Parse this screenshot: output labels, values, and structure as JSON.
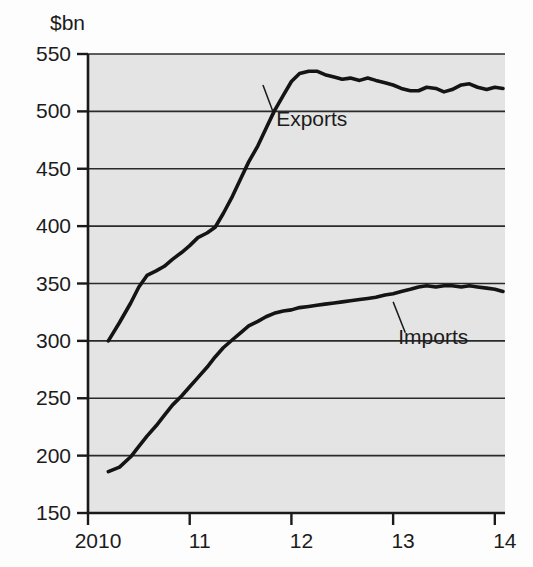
{
  "chart_data": {
    "type": "line",
    "title": "",
    "subtitle": "",
    "unit_label": "$bn",
    "xlabel": "",
    "ylabel": "$bn",
    "grid": true,
    "legend_position": "inline-annotations",
    "xlim": [
      2010.0,
      2014.1
    ],
    "ylim": [
      150,
      550
    ],
    "y_ticks": [
      150,
      200,
      250,
      300,
      350,
      400,
      450,
      500,
      550
    ],
    "y_tick_labels": [
      "150",
      "200",
      "250",
      "300",
      "350",
      "400",
      "450",
      "500",
      "550"
    ],
    "x_ticks": [
      2010,
      2011,
      2012,
      2013,
      2014
    ],
    "x_tick_labels": [
      "2010",
      "11",
      "12",
      "13",
      "14"
    ],
    "annotations": [
      {
        "text": "Exports",
        "x": 2011.85,
        "y": 487
      },
      {
        "text": "Imports",
        "x": 2013.05,
        "y": 297
      }
    ],
    "series": [
      {
        "name": "Exports",
        "color": "#141414",
        "x": [
          2010.2,
          2010.31,
          2010.42,
          2010.5,
          2010.58,
          2010.67,
          2010.75,
          2010.83,
          2010.92,
          2011.0,
          2011.08,
          2011.17,
          2011.25,
          2011.33,
          2011.42,
          2011.5,
          2011.58,
          2011.67,
          2011.75,
          2011.83,
          2011.92,
          2012.0,
          2012.08,
          2012.17,
          2012.25,
          2012.33,
          2012.42,
          2012.5,
          2012.58,
          2012.67,
          2012.75,
          2012.83,
          2012.92,
          2013.0,
          2013.08,
          2013.17,
          2013.25,
          2013.33,
          2013.42,
          2013.5,
          2013.58,
          2013.67,
          2013.75,
          2013.83,
          2013.92,
          2014.0,
          2014.08
        ],
        "values": [
          300,
          316,
          333,
          347,
          357,
          361,
          365,
          371,
          377,
          383,
          390,
          394,
          399,
          411,
          426,
          441,
          456,
          470,
          485,
          500,
          514,
          526,
          533,
          535,
          535,
          532,
          530,
          528,
          529,
          527,
          529,
          527,
          525,
          523,
          520,
          518,
          518,
          521,
          520,
          517,
          519,
          523,
          524,
          521,
          519,
          521,
          520
        ]
      },
      {
        "name": "Imports",
        "color": "#141414",
        "x": [
          2010.2,
          2010.31,
          2010.42,
          2010.5,
          2010.58,
          2010.67,
          2010.75,
          2010.83,
          2010.92,
          2011.0,
          2011.08,
          2011.17,
          2011.25,
          2011.33,
          2011.42,
          2011.5,
          2011.58,
          2011.67,
          2011.75,
          2011.83,
          2011.92,
          2012.0,
          2012.08,
          2012.17,
          2012.25,
          2012.33,
          2012.42,
          2012.5,
          2012.58,
          2012.67,
          2012.75,
          2012.83,
          2012.92,
          2013.0,
          2013.08,
          2013.17,
          2013.25,
          2013.33,
          2013.42,
          2013.5,
          2013.58,
          2013.67,
          2013.75,
          2013.83,
          2013.92,
          2014.0,
          2014.08
        ],
        "values": [
          186,
          190,
          199,
          208,
          217,
          226,
          235,
          244,
          252,
          260,
          268,
          277,
          286,
          294,
          301,
          307,
          313,
          317,
          321,
          324,
          326,
          327,
          329,
          330,
          331,
          332,
          333,
          334,
          335,
          336,
          337,
          338,
          340,
          341,
          343,
          345,
          347,
          348,
          347,
          348,
          348,
          347,
          348,
          347,
          346,
          345,
          343
        ]
      }
    ]
  },
  "chart_meta": {
    "plot_bg_color": "#e4e4e4",
    "page_bg_color": "#fdfdfd",
    "line_color": "#141414",
    "grid_color": "#2a2a2a",
    "axis_color": "#1a1a1a"
  }
}
